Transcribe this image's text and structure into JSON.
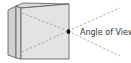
{
  "diagram": {
    "label": "Angle of View",
    "colors": {
      "box_front": "#e3e3e3",
      "box_side": "#cfcfcf",
      "box_top": "#d9d9d9",
      "outline": "#555555",
      "dash": "#9a9a9a",
      "lens": "#111111",
      "text": "#333333"
    },
    "elements": [
      "camera-body",
      "lens-point",
      "view-cone-lines",
      "angle-of-view-label"
    ]
  }
}
